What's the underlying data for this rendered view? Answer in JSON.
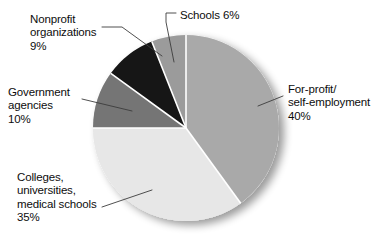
{
  "chart_data": {
    "type": "pie",
    "title": "",
    "subtitle": "",
    "xlabel": "",
    "ylabel": "",
    "legend_position": "none",
    "grid": false,
    "start_angle_deg": 0,
    "direction": "clockwise",
    "units": "percent",
    "categories": [
      "For-profit/ self-employment",
      "Colleges, universities, medical schools",
      "Government agencies",
      "Nonprofit organizations",
      "Schools"
    ],
    "values": [
      40,
      35,
      10,
      9,
      6
    ],
    "slices": [
      {
        "id": "for-profit",
        "name": "For-profit/ self-employment",
        "label_lines": [
          "For-profit/",
          "self-employment",
          "40%"
        ],
        "value": 40,
        "value_text": "40%",
        "color": "#a9a9a9",
        "start_deg": 0,
        "end_deg": 144
      },
      {
        "id": "colleges",
        "name": "Colleges, universities, medical schools",
        "label_lines": [
          "Colleges,",
          "universities,",
          "medical schools",
          "35%"
        ],
        "value": 35,
        "value_text": "35%",
        "color": "#e7e7e7",
        "start_deg": 144,
        "end_deg": 270
      },
      {
        "id": "government",
        "name": "Government agencies",
        "label_lines": [
          "Government",
          "agencies",
          "10%"
        ],
        "value": 10,
        "value_text": "10%",
        "color": "#757575",
        "start_deg": 270,
        "end_deg": 306
      },
      {
        "id": "nonprofit",
        "name": "Nonprofit organizations",
        "label_lines": [
          "Nonprofit",
          "organizations",
          "9%"
        ],
        "value": 9,
        "value_text": "9%",
        "color": "#141414",
        "start_deg": 306,
        "end_deg": 338.4
      },
      {
        "id": "schools",
        "name": "Schools",
        "label_lines": [
          "Schools 6%"
        ],
        "value": 6,
        "value_text": "6%",
        "color": "#9b9b9b",
        "start_deg": 338.4,
        "end_deg": 360
      }
    ]
  },
  "labels": {
    "nonprofit": "Nonprofit\norganizations\n9%",
    "schools": "Schools 6%",
    "government": "Government\nagencies\n10%",
    "for_profit": "For-profit/\nself-employment\n40%",
    "colleges": "Colleges,\nuniversities,\nmedical schools\n35%"
  },
  "colors": {
    "for_profit": "#a9a9a9",
    "colleges": "#e7e7e7",
    "government": "#757575",
    "nonprofit": "#141414",
    "schools": "#9b9b9b",
    "separator": "#ffffff",
    "leader_line": "#3c3c3c",
    "background": "#ffffff",
    "text": "#0d0d0d"
  }
}
